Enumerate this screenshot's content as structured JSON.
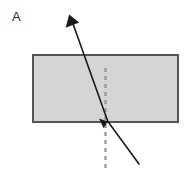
{
  "figure": {
    "panel_label": "A",
    "type": "optics-refraction-diagram",
    "canvas": {
      "width": 188,
      "height": 176,
      "background": "#ffffff"
    },
    "colors": {
      "slab_fill": "#d5d5d5",
      "slab_stroke": "#555555",
      "ray_stroke": "#1a1a1a",
      "normal_stroke": "#9a9a9a",
      "label_color": "#2b2b2b"
    },
    "slab": {
      "name": "glass-slab",
      "x": 33,
      "y": 55,
      "width": 145,
      "height": 67,
      "stroke_width": 1.6
    },
    "normal_line": {
      "name": "normal-dashed-line",
      "x": 105.5,
      "y_start": 68,
      "y_end": 172,
      "stroke_width": 2.4,
      "dash": "4 4"
    },
    "incident_ray": {
      "name": "incident-ray",
      "x1": 139,
      "y1": 164,
      "x2": 109,
      "y2": 123,
      "stroke_width": 1.6,
      "arrow_at": "end"
    },
    "refracted_ray": {
      "name": "refracted-ray",
      "x1": 108,
      "y1": 122,
      "x2": 70.5,
      "y2": 17,
      "stroke_width": 1.6,
      "arrow_at": "end"
    },
    "incident_arrowhead": {
      "name": "incident-arrowhead",
      "points": "108.6,122.6 99.8,119.4 104.2,128.4"
    },
    "refracted_arrowhead": {
      "name": "refracted-arrowhead",
      "points": "69.4,14.8 65.8,27.4 79.0,23.2"
    }
  }
}
